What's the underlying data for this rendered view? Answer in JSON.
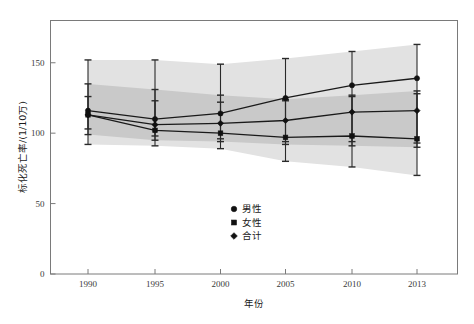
{
  "chart_data": {
    "type": "line",
    "title": "",
    "xlabel": "年份",
    "ylabel": "标化死亡率/(1/10万)",
    "x": [
      1990,
      1995,
      2000,
      2005,
      2010,
      2013
    ],
    "xticklabels": [
      "1990",
      "1995",
      "2000",
      "2005",
      "2010",
      "2013"
    ],
    "yticklabels": [
      "0",
      "50",
      "100",
      "150"
    ],
    "yticks": [
      0,
      50,
      100,
      150
    ],
    "ylim": [
      0,
      180
    ],
    "xlim": [
      1987.5,
      2015.5
    ],
    "grid": false,
    "legend_position": "center-bottom-inside",
    "series": [
      {
        "name": "男性",
        "marker": "circle",
        "values": [
          116,
          110,
          114,
          125,
          134,
          139
        ],
        "err_low": [
          92,
          91,
          89,
          80,
          76,
          70
        ],
        "err_high": [
          152,
          152,
          149,
          153,
          158,
          163
        ]
      },
      {
        "name": "女性",
        "marker": "square",
        "values": [
          113,
          102,
          100,
          97,
          98,
          96
        ],
        "err_low": [
          99,
          95,
          94,
          92,
          91,
          90
        ],
        "err_high": [
          135,
          131,
          127,
          124,
          127,
          130
        ]
      },
      {
        "name": "合计",
        "marker": "diamond",
        "values": [
          113,
          106,
          107,
          109,
          115,
          116
        ],
        "err_low": [
          103,
          98,
          96,
          94,
          94,
          93
        ],
        "err_high": [
          126,
          123,
          122,
          123,
          126,
          128
        ]
      }
    ],
    "bands": [
      {
        "name": "outer-confidence-band",
        "color": "#e2e2e2",
        "upper": [
          152,
          152,
          149,
          153,
          158,
          163
        ],
        "lower": [
          92,
          91,
          89,
          80,
          76,
          70
        ]
      },
      {
        "name": "inner-confidence-band",
        "color": "#c9c9c9",
        "upper": [
          135,
          131,
          127,
          124,
          127,
          130
        ],
        "lower": [
          99,
          95,
          94,
          92,
          91,
          90
        ]
      }
    ],
    "colors": {
      "line": "#1a1a1a",
      "marker": "#111111",
      "frame": "#7a7a7a",
      "band_outer": "#e2e2e2",
      "band_inner": "#c9c9c9",
      "background": "#ffffff"
    }
  },
  "legend": {
    "items": [
      {
        "label": "男性",
        "marker": "circle"
      },
      {
        "label": "女性",
        "marker": "square"
      },
      {
        "label": "合计",
        "marker": "diamond"
      }
    ]
  },
  "axes": {
    "x_title": "年份",
    "y_title": "标化死亡率/(1/10万)",
    "x_ticks": [
      "1990",
      "1995",
      "2000",
      "2005",
      "2010",
      "2013"
    ],
    "y_ticks": [
      "150",
      "100",
      "50",
      "0"
    ]
  }
}
